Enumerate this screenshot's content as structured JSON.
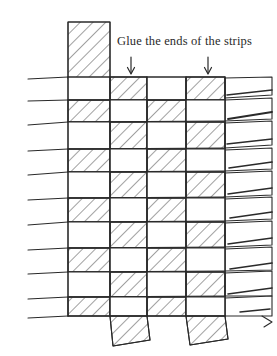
{
  "figure": {
    "kind": "weaving-diagram",
    "title_text": "Glue the ends of the strips",
    "ink_color": "#2a2a2a",
    "paper_color": "#ffffff",
    "hatch_color": "#4a4a4a"
  },
  "caption": {
    "text": "Glue the ends of the strips",
    "x": 117,
    "y": 34
  },
  "annotations": {
    "arrows": [
      {
        "name": "arrow-left",
        "x": 131,
        "y_top": 58,
        "y_bottom": 74
      },
      {
        "name": "arrow-right",
        "x": 208,
        "y_top": 58,
        "y_bottom": 74
      }
    ]
  },
  "weave": {
    "type": "plain-weave",
    "columns": 4,
    "rows": 9,
    "column_edges": [
      68,
      110,
      147,
      186,
      225
    ],
    "row_edges": [
      77,
      100,
      122,
      149,
      172,
      198,
      222,
      248,
      272,
      297,
      316
    ],
    "left_extent": 28,
    "right_extent": 272,
    "top_extent": 22,
    "bottom_extent": 345
  },
  "strips": {
    "vertical_top": {
      "name": "top-vertical-strip",
      "x": 68,
      "width": 42,
      "y": 22,
      "height": 56,
      "hatched": true
    },
    "vertical_bottom": [
      {
        "name": "bottom-vertical-strip-1",
        "x": 110,
        "width": 37,
        "y": 314,
        "height": 32,
        "hatched": true
      },
      {
        "name": "bottom-vertical-strip-2",
        "x": 186,
        "width": 39,
        "y": 314,
        "height": 31,
        "hatched": true
      }
    ],
    "left_tails_count": 5,
    "right_fringe_count": 9
  }
}
